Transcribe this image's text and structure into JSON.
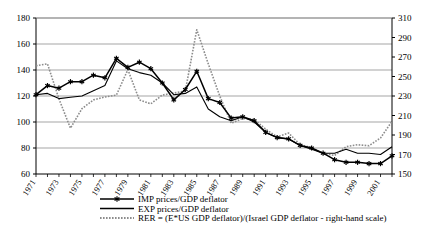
{
  "chart_data": {
    "type": "line",
    "title": "",
    "xlabel": "",
    "ylabel": "",
    "y2label": "",
    "grid": true,
    "legend_position": "bottom",
    "ylim": [
      60,
      180
    ],
    "y2lim": [
      150,
      310
    ],
    "yticks": [
      60,
      80,
      100,
      120,
      140,
      160,
      180
    ],
    "y2ticks": [
      150,
      170,
      190,
      210,
      230,
      250,
      270,
      290,
      310
    ],
    "xlim": [
      1971,
      2002
    ],
    "x": [
      1971,
      1972,
      1973,
      1974,
      1975,
      1976,
      1977,
      1978,
      1979,
      1980,
      1981,
      1982,
      1983,
      1984,
      1985,
      1986,
      1987,
      1988,
      1989,
      1990,
      1991,
      1992,
      1993,
      1994,
      1995,
      1996,
      1997,
      1998,
      1999,
      2000,
      2001,
      2002
    ],
    "xtick_labels": [
      "1971",
      "1973",
      "1975",
      "1977",
      "1979",
      "1981",
      "1983",
      "1985",
      "1987",
      "1989",
      "1991",
      "1993",
      "1995",
      "1997",
      "1999",
      "2001"
    ],
    "xticks_labeled": [
      1971,
      1973,
      1975,
      1977,
      1979,
      1981,
      1983,
      1985,
      1987,
      1989,
      1991,
      1993,
      1995,
      1997,
      1999,
      2001
    ],
    "series": [
      {
        "name": "IMP prices/GDP deflator",
        "axis": "left",
        "marker": "star",
        "style": "solid-thick",
        "color": "#000000",
        "values": [
          121,
          128,
          126,
          131,
          131,
          136,
          134,
          149,
          142,
          146,
          141,
          130,
          117,
          125,
          139,
          118,
          115,
          103,
          104,
          101,
          92,
          88,
          87,
          82,
          80,
          76,
          71,
          69,
          69,
          68,
          68,
          74
        ]
      },
      {
        "name": "EXP prices/GDP deflator",
        "axis": "left",
        "marker": "none",
        "style": "solid-thin",
        "color": "#000000",
        "values": [
          121,
          122,
          118,
          119,
          120,
          124,
          128,
          147,
          141,
          138,
          136,
          130,
          121,
          122,
          127,
          110,
          104,
          101,
          104,
          100,
          92,
          88,
          87,
          82,
          79,
          76,
          76,
          79,
          76,
          76,
          75,
          81
        ]
      },
      {
        "name": "RER  = (E*US GDP deflator)/(Israel GDP deflator - right-hand scale)",
        "axis": "right",
        "marker": "none",
        "style": "dotted",
        "color": "#8c8c8c",
        "values_left_scale": [
          143,
          144,
          118,
          95,
          110,
          117,
          119,
          120,
          140,
          117,
          114,
          121,
          122,
          124,
          171,
          145,
          120,
          99,
          103,
          102,
          95,
          89,
          92,
          83,
          80,
          76,
          75,
          81,
          83,
          82,
          88,
          101
        ],
        "values": [
          261,
          263,
          227,
          197,
          217,
          226,
          229,
          231,
          257,
          226,
          222,
          231,
          233,
          235,
          298,
          263,
          230,
          202,
          207,
          206,
          196,
          188,
          192,
          180,
          177,
          171,
          169,
          178,
          180,
          179,
          187,
          204
        ]
      }
    ]
  },
  "legend": {
    "items": [
      {
        "label": "IMP prices/GDP deflator",
        "style": "solid-thick-star"
      },
      {
        "label": "EXP prices/GDP deflator",
        "style": "solid-thin"
      },
      {
        "label": "RER  = (E*US GDP deflator)/(Israel GDP deflator - right-hand scale)",
        "style": "dotted"
      }
    ]
  },
  "colors": {
    "line_primary": "#000000",
    "line_rer": "#8c8c8c",
    "grid": "#808080",
    "axis": "#000000",
    "background": "#ffffff"
  }
}
